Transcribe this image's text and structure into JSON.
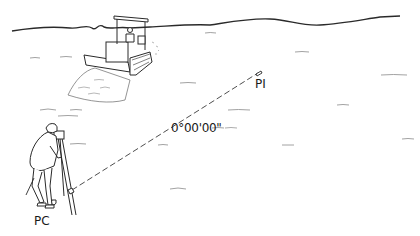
{
  "diagram": {
    "labels": {
      "pc": "PC",
      "pi": "PI",
      "angle": "0°00'00\""
    },
    "elements": [
      {
        "name": "horizon-line",
        "description": "wavy horizon line across top"
      },
      {
        "name": "bulldozer",
        "description": "bulldozer with operator pushing soil"
      },
      {
        "name": "surveyor",
        "description": "person looking through instrument"
      },
      {
        "name": "theodolite-tripod",
        "description": "instrument on tripod"
      },
      {
        "name": "sight-line",
        "description": "dashed line from instrument to PI marker"
      },
      {
        "name": "pi-marker",
        "description": "small stake/marker at PI"
      }
    ],
    "colors": {
      "line": "#2a2a2a",
      "light_line": "#8a8a8a",
      "background": "#ffffff"
    }
  }
}
